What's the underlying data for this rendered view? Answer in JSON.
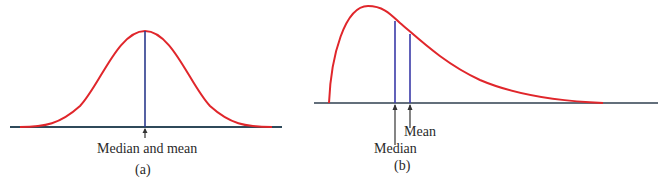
{
  "panels": [
    {
      "id": "a",
      "caption": "(a)",
      "distribution": "symmetric",
      "annotations": [
        {
          "label": "Median and mean"
        }
      ]
    },
    {
      "id": "b",
      "caption": "(b)",
      "distribution": "right-skewed",
      "annotations": [
        {
          "label": "Median"
        },
        {
          "label": "Mean"
        }
      ]
    }
  ],
  "colors": {
    "curve": "#e0262b",
    "marker_line": "#2b3a8c",
    "baseline": "#2f3f4f",
    "arrow": "#333333",
    "text": "#2a2a2a"
  }
}
